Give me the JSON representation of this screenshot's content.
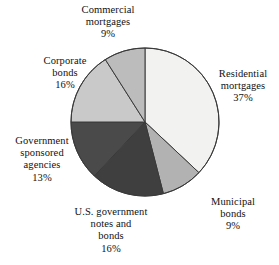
{
  "chart_data": {
    "type": "pie",
    "title": "",
    "subtitle": "",
    "xlabel": "",
    "ylabel": "",
    "legend_position": "none",
    "grid": false,
    "label_format": "name above percent",
    "start_angle_deg": 0,
    "direction": "clockwise",
    "categories": [
      "Residential mortgages",
      "Municipal bonds",
      "U.S. government notes and bonds",
      "Government sponsored agencies",
      "Corporate bonds",
      "Commercial mortgages"
    ],
    "values": [
      37,
      9,
      16,
      13,
      16,
      9
    ],
    "unit": "%",
    "slices": [
      {
        "id": "residential-mortgages",
        "label_line1": "Residential",
        "label_line2": "mortgages",
        "label_full": "Residential mortgages",
        "value": 37,
        "value_text": "37%",
        "color": "#f2f2f0"
      },
      {
        "id": "municipal-bonds",
        "label_line1": "Municipal",
        "label_line2": "bonds",
        "label_full": "Municipal bonds",
        "value": 9,
        "value_text": "9%",
        "color": "#b2b2b2"
      },
      {
        "id": "us-government-notes-and-bonds",
        "label_line1": "U.S. government",
        "label_line2": "notes and",
        "label_line3": "bonds",
        "label_full": "U.S. government notes and bonds",
        "value": 16,
        "value_text": "16%",
        "color": "#3f3f3f"
      },
      {
        "id": "government-sponsored-agencies",
        "label_line1": "Government",
        "label_line2": "sponsored",
        "label_line3": "agencies",
        "label_full": "Government sponsored agencies",
        "value": 13,
        "value_text": "13%",
        "color": "#4a4a4a"
      },
      {
        "id": "corporate-bonds",
        "label_line1": "Corporate",
        "label_line2": "bonds",
        "label_full": "Corporate bonds",
        "value": 16,
        "value_text": "16%",
        "color": "#c9c9c9"
      },
      {
        "id": "commercial-mortgages",
        "label_line1": "Commercial",
        "label_line2": "mortgages",
        "label_full": "Commercial mortgages",
        "value": 9,
        "value_text": "9%",
        "color": "#bcbcbc"
      }
    ],
    "outline_color": "#3a3a3a",
    "background_color": "#ffffff"
  }
}
